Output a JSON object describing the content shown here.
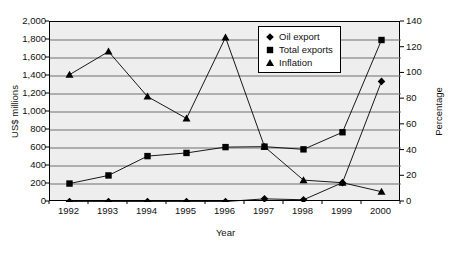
{
  "chart_data": {
    "type": "line",
    "title": "",
    "xlabel": "Year",
    "ylabel": "US$ millions",
    "y2label": "Percentage",
    "categories": [
      "1992",
      "1993",
      "1994",
      "1995",
      "1996",
      "1997",
      "1998",
      "1999",
      "2000"
    ],
    "ylim": [
      0,
      2000
    ],
    "y2lim": [
      0,
      140
    ],
    "yticks": [
      "0",
      "200",
      "400",
      "600",
      "800",
      "1,000",
      "1,200",
      "1,400",
      "1,600",
      "1,800",
      "2,000"
    ],
    "ytick_values": [
      0,
      200,
      400,
      600,
      800,
      1000,
      1200,
      1400,
      1600,
      1800,
      2000
    ],
    "y2ticks": [
      "0",
      "20",
      "40",
      "60",
      "80",
      "100",
      "120",
      "140"
    ],
    "y2tick_values": [
      0,
      20,
      40,
      60,
      80,
      100,
      120,
      140
    ],
    "grid": true,
    "legend_position": "top-right-inside",
    "series": [
      {
        "name": "Oil export",
        "marker": "diamond",
        "axis": "left",
        "unit": "US$ millions",
        "values": [
          5,
          5,
          5,
          5,
          5,
          35,
          25,
          215,
          1340
        ]
      },
      {
        "name": "Total exports",
        "marker": "square",
        "axis": "left",
        "unit": "US$ millions",
        "values": [
          205,
          295,
          510,
          545,
          610,
          615,
          585,
          775,
          1800
        ]
      },
      {
        "name": "Inflation",
        "marker": "triangle",
        "axis": "right",
        "unit": "Percentage",
        "values": [
          99,
          117,
          82,
          65,
          128,
          43,
          17,
          15,
          8
        ]
      }
    ]
  },
  "legend": {
    "items": [
      {
        "label": "Oil export",
        "marker": "diamond"
      },
      {
        "label": "Total exports",
        "marker": "square"
      },
      {
        "label": "Inflation",
        "marker": "triangle"
      }
    ]
  }
}
